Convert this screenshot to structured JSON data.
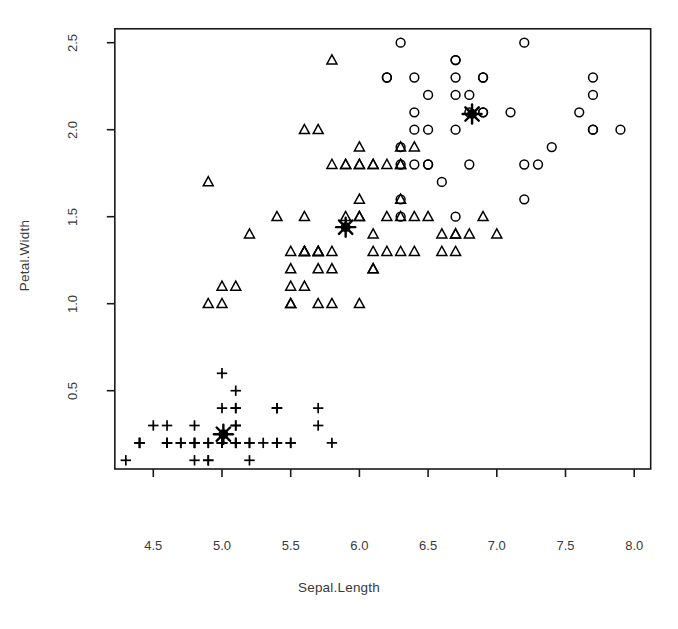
{
  "chart_data": {
    "type": "scatter",
    "title": "",
    "xlabel": "Sepal.Length",
    "ylabel": "Petal.Width",
    "xlim": [
      4.22,
      8.12
    ],
    "ylim": [
      0.05,
      2.58
    ],
    "xticks": [
      4.5,
      5.0,
      5.5,
      6.0,
      6.5,
      7.0,
      7.5,
      8.0
    ],
    "yticks": [
      0.5,
      1.0,
      1.5,
      2.0,
      2.5
    ],
    "xtick_labels": [
      "4.5",
      "5.0",
      "5.5",
      "6.0",
      "6.5",
      "7.0",
      "7.5",
      "8.0"
    ],
    "ytick_labels": [
      "0.5",
      "1.0",
      "1.5",
      "2.0",
      "2.5"
    ],
    "grid": false,
    "legend": "none",
    "box": true,
    "marker_color": "#000000",
    "series": [
      {
        "name": "cluster-1",
        "marker": "plus",
        "points": [
          [
            5.1,
            0.2
          ],
          [
            4.9,
            0.2
          ],
          [
            4.7,
            0.2
          ],
          [
            4.6,
            0.2
          ],
          [
            5.0,
            0.2
          ],
          [
            5.4,
            0.4
          ],
          [
            4.6,
            0.3
          ],
          [
            5.0,
            0.2
          ],
          [
            4.4,
            0.2
          ],
          [
            4.9,
            0.1
          ],
          [
            5.4,
            0.2
          ],
          [
            4.8,
            0.2
          ],
          [
            4.8,
            0.1
          ],
          [
            4.3,
            0.1
          ],
          [
            5.8,
            0.2
          ],
          [
            5.7,
            0.4
          ],
          [
            5.4,
            0.4
          ],
          [
            5.1,
            0.3
          ],
          [
            5.7,
            0.3
          ],
          [
            5.1,
            0.3
          ],
          [
            5.4,
            0.2
          ],
          [
            5.1,
            0.4
          ],
          [
            4.6,
            0.2
          ],
          [
            5.1,
            0.5
          ],
          [
            4.8,
            0.2
          ],
          [
            5.0,
            0.2
          ],
          [
            5.0,
            0.4
          ],
          [
            5.2,
            0.2
          ],
          [
            5.2,
            0.2
          ],
          [
            4.7,
            0.2
          ],
          [
            4.8,
            0.2
          ],
          [
            5.4,
            0.4
          ],
          [
            5.2,
            0.1
          ],
          [
            5.5,
            0.2
          ],
          [
            4.9,
            0.2
          ],
          [
            5.0,
            0.2
          ],
          [
            5.5,
            0.2
          ],
          [
            4.9,
            0.1
          ],
          [
            4.4,
            0.2
          ],
          [
            5.1,
            0.2
          ],
          [
            5.0,
            0.2
          ],
          [
            4.5,
            0.3
          ],
          [
            4.4,
            0.2
          ],
          [
            5.0,
            0.6
          ],
          [
            5.1,
            0.4
          ],
          [
            4.8,
            0.3
          ],
          [
            5.1,
            0.2
          ],
          [
            4.6,
            0.2
          ],
          [
            5.3,
            0.2
          ],
          [
            5.0,
            0.2
          ]
        ]
      },
      {
        "name": "cluster-2",
        "marker": "triangle",
        "points": [
          [
            7.0,
            1.4
          ],
          [
            6.4,
            1.5
          ],
          [
            6.9,
            1.5
          ],
          [
            5.5,
            1.3
          ],
          [
            6.5,
            1.5
          ],
          [
            5.7,
            1.3
          ],
          [
            6.3,
            1.6
          ],
          [
            4.9,
            1.0
          ],
          [
            6.6,
            1.3
          ],
          [
            5.2,
            1.4
          ],
          [
            5.0,
            1.0
          ],
          [
            5.9,
            1.5
          ],
          [
            6.0,
            1.0
          ],
          [
            6.1,
            1.4
          ],
          [
            5.6,
            1.3
          ],
          [
            6.7,
            1.4
          ],
          [
            5.6,
            1.5
          ],
          [
            5.8,
            1.0
          ],
          [
            6.2,
            1.5
          ],
          [
            5.6,
            1.1
          ],
          [
            5.9,
            1.8
          ],
          [
            6.1,
            1.3
          ],
          [
            6.3,
            1.5
          ],
          [
            6.1,
            1.2
          ],
          [
            6.4,
            1.3
          ],
          [
            6.6,
            1.4
          ],
          [
            6.8,
            1.4
          ],
          [
            6.7,
            1.4
          ],
          [
            6.0,
            1.5
          ],
          [
            5.7,
            1.0
          ],
          [
            5.5,
            1.0
          ],
          [
            5.5,
            1.1
          ],
          [
            5.8,
            1.2
          ],
          [
            6.0,
            1.6
          ],
          [
            5.4,
            1.5
          ],
          [
            6.0,
            1.5
          ],
          [
            6.7,
            1.3
          ],
          [
            6.3,
            1.3
          ],
          [
            5.6,
            1.3
          ],
          [
            5.5,
            1.2
          ],
          [
            5.5,
            1.0
          ],
          [
            6.1,
            1.2
          ],
          [
            5.8,
            1.3
          ],
          [
            5.0,
            1.1
          ],
          [
            5.6,
            1.3
          ],
          [
            5.7,
            1.2
          ],
          [
            5.7,
            1.3
          ],
          [
            6.2,
            1.3
          ],
          [
            5.1,
            1.1
          ],
          [
            5.7,
            1.3
          ],
          [
            4.9,
            1.7
          ],
          [
            6.0,
            1.8
          ],
          [
            6.3,
            1.8
          ],
          [
            6.1,
            1.8
          ],
          [
            6.3,
            1.8
          ],
          [
            6.2,
            1.8
          ],
          [
            5.9,
            1.8
          ],
          [
            6.0,
            1.8
          ],
          [
            5.8,
            1.8
          ],
          [
            5.7,
            2.0
          ],
          [
            5.8,
            2.4
          ],
          [
            6.3,
            1.9
          ],
          [
            6.4,
            1.9
          ],
          [
            6.0,
            1.9
          ],
          [
            5.6,
            2.0
          ],
          [
            6.1,
            1.8
          ]
        ]
      },
      {
        "name": "cluster-3",
        "marker": "circle",
        "points": [
          [
            6.3,
            2.5
          ],
          [
            7.1,
            2.1
          ],
          [
            6.5,
            2.2
          ],
          [
            7.6,
            2.1
          ],
          [
            7.3,
            1.8
          ],
          [
            6.7,
            2.2
          ],
          [
            7.2,
            1.8
          ],
          [
            6.5,
            1.8
          ],
          [
            6.4,
            2.1
          ],
          [
            6.8,
            2.2
          ],
          [
            7.7,
            2.3
          ],
          [
            7.7,
            2.0
          ],
          [
            6.9,
            2.1
          ],
          [
            7.7,
            2.0
          ],
          [
            6.7,
            2.4
          ],
          [
            6.9,
            2.3
          ],
          [
            7.2,
            2.5
          ],
          [
            6.2,
            2.3
          ],
          [
            7.4,
            1.9
          ],
          [
            7.9,
            2.0
          ],
          [
            6.4,
            2.0
          ],
          [
            7.7,
            2.2
          ],
          [
            6.4,
            2.3
          ],
          [
            6.9,
            2.3
          ],
          [
            6.7,
            2.0
          ],
          [
            6.9,
            2.1
          ],
          [
            6.8,
            2.1
          ],
          [
            6.7,
            2.4
          ],
          [
            6.7,
            2.3
          ],
          [
            6.3,
            1.9
          ],
          [
            6.5,
            2.0
          ],
          [
            6.2,
            2.3
          ],
          [
            6.8,
            1.8
          ],
          [
            6.5,
            1.8
          ],
          [
            6.4,
            1.8
          ],
          [
            6.3,
            1.8
          ],
          [
            6.6,
            1.7
          ],
          [
            7.2,
            1.6
          ],
          [
            6.7,
            1.5
          ],
          [
            6.3,
            1.6
          ],
          [
            6.3,
            1.5
          ]
        ]
      }
    ],
    "centers": [
      {
        "name": "center-cluster-1",
        "marker": "star",
        "x": 5.01,
        "y": 0.25
      },
      {
        "name": "center-cluster-2",
        "marker": "star",
        "x": 5.9,
        "y": 1.44
      },
      {
        "name": "center-cluster-3",
        "marker": "star",
        "x": 6.82,
        "y": 2.09
      }
    ]
  }
}
